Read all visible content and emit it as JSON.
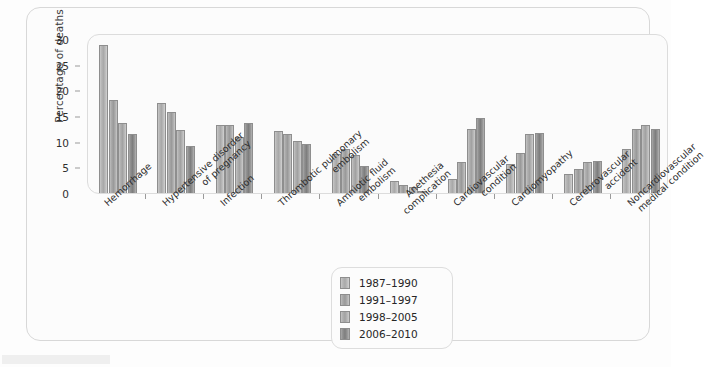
{
  "figure": {
    "background_color": "#fdfdfd",
    "frame_color": "#d8d8d8",
    "panel_color": "#fbfbfb"
  },
  "axis": {
    "y_title": "Percentage of deaths",
    "y_ticks": [
      "0",
      "5",
      "10",
      "15",
      "20",
      "25",
      "30"
    ]
  },
  "legend": {
    "entries": [
      {
        "label": "1987–1990",
        "color": "#b6b6b6"
      },
      {
        "label": "1991–1997",
        "color": "#a4a4a4"
      },
      {
        "label": "1998–2005",
        "color": "#b0b0b0"
      },
      {
        "label": "2006–2010",
        "color": "#8b8b8b"
      }
    ]
  },
  "chart_data": {
    "type": "bar",
    "title": "",
    "xlabel": "",
    "ylabel": "Percentage of deaths",
    "ylim": [
      0,
      30
    ],
    "yticks": [
      0,
      5,
      10,
      15,
      20,
      25,
      30
    ],
    "grid": false,
    "legend_position": "bottom-center",
    "categories": [
      "Hemorrhage",
      "Hypertensive disorder of pregnancy",
      "Infection",
      "Thrombotic pulmonary embolism",
      "Amniotic fluid embolism",
      "Anethesia complication",
      "Cardiovascular condition",
      "Cardiomyopathy",
      "Cerebrovascular accident",
      "Noncardiovascular medical condition"
    ],
    "category_lines": [
      [
        "Hemorrhage",
        ""
      ],
      [
        "Hypertensive disorder",
        "of pregnancy"
      ],
      [
        "Infection",
        ""
      ],
      [
        "Thrombotic pulmonary",
        "embolism"
      ],
      [
        "Amniotic fluid",
        "embolism"
      ],
      [
        "Anethesia",
        "complication"
      ],
      [
        "Cardiovascular",
        "condition"
      ],
      [
        "Cardiomyopathy",
        ""
      ],
      [
        "Cerebrovascular",
        "accident"
      ],
      [
        "Noncardiovascular",
        "medical condition"
      ]
    ],
    "series": [
      {
        "name": "1987–1990",
        "values": [
          28.8,
          17.6,
          13.2,
          12.1,
          7.6,
          2.4,
          2.8,
          5.6,
          3.8,
          8.6
        ]
      },
      {
        "name": "1991–1997",
        "values": [
          18.2,
          15.8,
          13.3,
          11.4,
          8.6,
          1.5,
          6.1,
          7.8,
          4.6,
          12.5
        ]
      },
      {
        "name": "1998–2005",
        "values": [
          13.7,
          12.2,
          10.9,
          10.2,
          7.4,
          1.1,
          12.4,
          11.5,
          6.1,
          13.3
        ]
      },
      {
        "name": "2006–2010",
        "values": [
          11.4,
          9.2,
          13.7,
          9.6,
          5.3,
          0.3,
          14.6,
          11.6,
          6.2,
          12.5
        ]
      }
    ]
  }
}
